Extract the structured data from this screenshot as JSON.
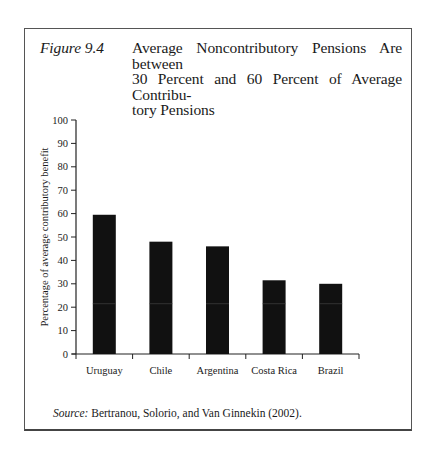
{
  "figure": {
    "label": "Figure 9.4",
    "title_lines": [
      "Average Noncontributory Pensions Are between",
      "30 Percent and 60 Percent of Average Contribu-",
      "tory Pensions"
    ],
    "source_label": "Source:",
    "source_text": " Bertranou, Solorio, and Van Ginnekin (2002)."
  },
  "chart_data": {
    "type": "bar",
    "categories": [
      "Uruguay",
      "Chile",
      "Argentina",
      "Costa Rica",
      "Brazil"
    ],
    "values": [
      59.5,
      48,
      46,
      31.5,
      30
    ],
    "xlabel": "",
    "ylabel": "Percentage of average contributory benefit",
    "ylim": [
      0,
      100
    ],
    "yticks": [
      0,
      10,
      20,
      30,
      40,
      50,
      60,
      70,
      80,
      90,
      100
    ],
    "grid": false,
    "legend": null,
    "bar_color": "#111111"
  }
}
